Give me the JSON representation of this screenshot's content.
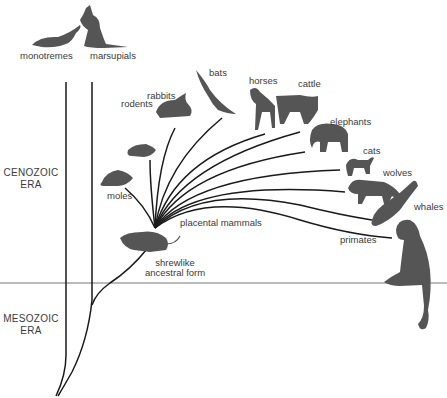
{
  "diagram": {
    "colors": {
      "line": "#1a1a1a",
      "silhouette": "#555555",
      "text": "#3a3a3a",
      "background": "#ffffff"
    },
    "eras": [
      {
        "id": "cenozoic",
        "line1": "CENOZOIC",
        "line2": "ERA"
      },
      {
        "id": "mesozoic",
        "line1": "MESOZOIC",
        "line2": "ERA"
      }
    ],
    "lineages": {
      "monotremes": "monotremes",
      "marsupials": "marsupials",
      "placental": "placental mammals",
      "ancestor_line1": "shrewlike",
      "ancestor_line2": "ancestral form"
    },
    "placental_groups": [
      {
        "id": "moles",
        "label": "moles"
      },
      {
        "id": "rodents",
        "label": "rodents"
      },
      {
        "id": "rabbits",
        "label": "rabbits"
      },
      {
        "id": "bats",
        "label": "bats"
      },
      {
        "id": "horses",
        "label": "horses"
      },
      {
        "id": "cattle",
        "label": "cattle"
      },
      {
        "id": "elephants",
        "label": "elephants"
      },
      {
        "id": "cats",
        "label": "cats"
      },
      {
        "id": "wolves",
        "label": "wolves"
      },
      {
        "id": "whales",
        "label": "whales"
      },
      {
        "id": "primates",
        "label": "primates"
      }
    ]
  }
}
